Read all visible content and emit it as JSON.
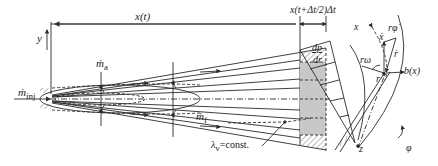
{
  "diagram": {
    "left_panel": {
      "axis_y_label": "y",
      "axis_x_label": "x(t)",
      "slice_label": "x(t+Δt/2)Δt",
      "injection_mass_flow": "ṁ_inj",
      "inj_main": "ṁ",
      "inj_sub": "inj",
      "entrained_mass_flow_main": "ṁ",
      "entrained_mass_flow_sub": "a",
      "fuel_mass_flow_main": "ṁ",
      "fuel_mass_flow_sub": "f",
      "constant_label_main": "λ",
      "constant_label_sub": "v",
      "constant_label_rest": "=const."
    },
    "right_panel": {
      "gradient_num": "dp",
      "gradient_den": "dr",
      "x_axis_label": "x",
      "x_dot": "ẋ",
      "r_phi_dot": "rφ̇",
      "r_dot": "ṙ",
      "r_omega": "rω",
      "r_label": "r",
      "width_label": "b(x)",
      "z_label": "z",
      "phi_label": "φ"
    },
    "colors": {
      "line": "#2a2a2a",
      "shade": "#c8c8c8",
      "background": "#ffffff"
    }
  }
}
